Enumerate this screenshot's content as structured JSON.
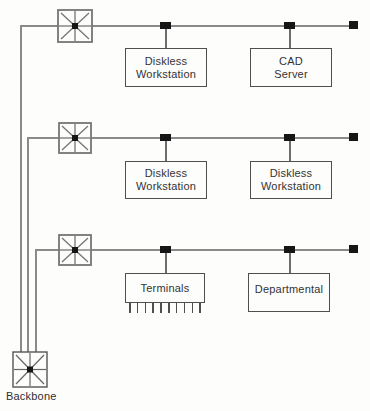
{
  "diagram": {
    "type": "network-topology"
  },
  "colors": {
    "background": "#fdfdfc",
    "bus_line": "#8a8a8a",
    "box_border": "#4f4f4f",
    "hub_stroke": "#757575",
    "tap_fill": "#161616",
    "text": "#333333"
  },
  "nodes": {
    "row1_box1": {
      "line1": "Diskless",
      "line2": "Workstation"
    },
    "row1_box2": {
      "line1": "CAD",
      "line2": "Server"
    },
    "row2_box1": {
      "line1": "Diskless",
      "line2": "Workstation"
    },
    "row2_box2": {
      "line1": "Diskless",
      "line2": "Workstation"
    },
    "row3_box1": {
      "line1": "Terminals"
    },
    "row3_box2": {
      "line1": "Departmental"
    },
    "backbone": {
      "label": "Backbone"
    }
  }
}
